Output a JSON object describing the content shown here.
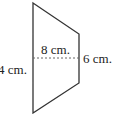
{
  "diagram": {
    "shape": "trapezoid",
    "labels": {
      "left_side": "4 cm.",
      "height": "8 cm.",
      "right_side": "6 cm."
    },
    "colors": {
      "stroke": "#333333",
      "dashed": "#666666",
      "background": "#ffffff"
    }
  }
}
